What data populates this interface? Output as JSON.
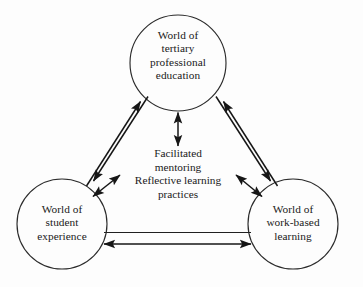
{
  "diagram": {
    "background_color": "#fdfdfd",
    "stroke_color": "#1a1a1a",
    "nodes": [
      {
        "id": "tertiary",
        "label": "World of\ntertiary\nprofessional\neducation",
        "cx": 178,
        "cy": 63,
        "r": 48
      },
      {
        "id": "student",
        "label": "World of\nstudent\nexperience",
        "cx": 62,
        "cy": 224,
        "r": 45
      },
      {
        "id": "work",
        "label": "World of\nwork-based\nlearning",
        "cx": 293,
        "cy": 224,
        "r": 45
      }
    ],
    "center": {
      "id": "center-practices",
      "label": "Facilitated\nmentoring\nReflective learning\npractices"
    },
    "connections": [
      {
        "id": "student-to-tertiary",
        "from": "student",
        "to": "tertiary",
        "style": "single-arrow"
      },
      {
        "id": "tertiary-to-student",
        "from": "tertiary",
        "to": "student",
        "style": "single-arrow"
      },
      {
        "id": "tertiary-to-work",
        "from": "tertiary",
        "to": "work",
        "style": "single-arrow"
      },
      {
        "id": "work-to-tertiary",
        "from": "work",
        "to": "tertiary",
        "style": "single-arrow"
      },
      {
        "id": "student-work-plain",
        "from": "student",
        "to": "work",
        "style": "plain-line"
      },
      {
        "id": "student-work-double",
        "from": "student",
        "to": "work",
        "style": "double-arrow"
      },
      {
        "id": "tertiary-center",
        "from": "tertiary",
        "to": "center-practices",
        "style": "double-arrow"
      },
      {
        "id": "student-center",
        "from": "student",
        "to": "center-practices",
        "style": "double-arrow"
      },
      {
        "id": "work-center",
        "from": "work",
        "to": "center-practices",
        "style": "double-arrow"
      }
    ]
  }
}
